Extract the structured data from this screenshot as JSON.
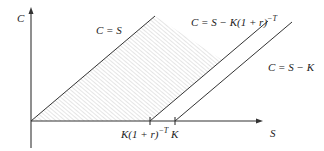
{
  "diagram": {
    "axes": {
      "x_label": "S",
      "y_label": "C"
    },
    "lines": [
      {
        "id": "upper-bound",
        "label": "C = S",
        "label_parts": [
          "C = S"
        ]
      },
      {
        "id": "lower-bound-discounted",
        "label": "C = S − K(1 + r)^−T",
        "label_parts": [
          "C = S − K(1 + r)",
          "−T"
        ]
      },
      {
        "id": "intrinsic-value",
        "label": "C = S − K",
        "label_parts": [
          "C = S − K"
        ]
      }
    ],
    "x_ticks": [
      {
        "label": "K(1 + r)^−T",
        "label_parts": [
          "K(1 + r)",
          "−T"
        ]
      },
      {
        "label": "K",
        "label_parts": [
          "K"
        ]
      }
    ],
    "shaded_region": "area between C = S and C = S − K(1 + r)^−T (hatched)",
    "colors": {
      "line": "#333333",
      "hatch": "#b5b5b5",
      "background": "#ffffff"
    }
  }
}
